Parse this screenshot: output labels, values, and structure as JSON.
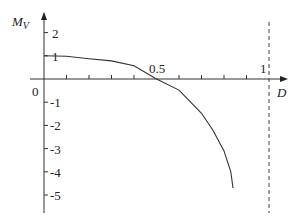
{
  "chart_data": {
    "type": "line",
    "title": "",
    "xlabel": "D",
    "ylabel": "M",
    "ylabel_subscript": "V",
    "origin_label": "0",
    "x_tick_labels": [
      "0.5",
      "1"
    ],
    "y_tick_labels": [
      "2",
      "1",
      "-1",
      "-2",
      "-3",
      "-4",
      "-5"
    ],
    "xlim": [
      0,
      1.05
    ],
    "ylim": [
      -5.8,
      2.7
    ],
    "grid": false,
    "asymptote": {
      "x": 1,
      "style": "dashed"
    },
    "series": [
      {
        "name": "M_V(D)",
        "x": [
          0,
          0.1,
          0.2,
          0.3,
          0.4,
          0.5,
          0.6,
          0.7,
          0.75,
          0.8,
          0.83,
          0.84
        ],
        "y": [
          1.0,
          0.98,
          0.87,
          0.78,
          0.57,
          0.0,
          -0.48,
          -1.48,
          -2.2,
          -3.1,
          -4.0,
          -4.7
        ]
      }
    ]
  }
}
